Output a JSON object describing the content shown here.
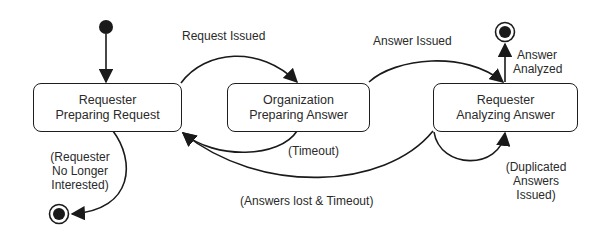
{
  "diagram": {
    "type": "state-machine",
    "states": [
      {
        "id": "s1",
        "line1": "Requester",
        "line2": "Preparing Request"
      },
      {
        "id": "s2",
        "line1": "Organization",
        "line2": "Preparing Answer"
      },
      {
        "id": "s3",
        "line1": "Requester",
        "line2": "Analyzing Answer"
      }
    ],
    "transitions": {
      "request_issued": "Request Issued",
      "answer_issued": "Answer Issued",
      "answer_analyzed_1": "Answer",
      "answer_analyzed_2": "Analyzed",
      "timeout": "(Timeout)",
      "answers_lost": "(Answers lost & Timeout)",
      "no_longer_1": "(Requester",
      "no_longer_2": "No Longer",
      "no_longer_3": "Interested)",
      "duplicated_1": "(Duplicated",
      "duplicated_2": "Answers",
      "duplicated_3": "Issued)"
    }
  }
}
